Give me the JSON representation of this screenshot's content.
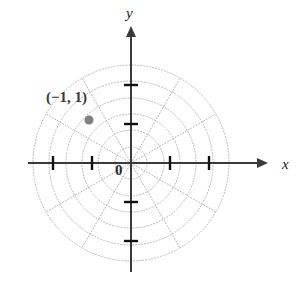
{
  "figure": {
    "background_color": "#ffffff",
    "width": 302,
    "height": 290
  },
  "axes": {
    "x_label": "x",
    "y_label": "y",
    "origin_label": "0",
    "origin": {
      "x": 131,
      "y": 163
    },
    "axis_color": "#3a3a3a",
    "x_axis": {
      "start_x": 28,
      "end_x": 268,
      "arrow": "right",
      "tick_offsets": [
        -78,
        -39,
        39,
        78
      ],
      "tick_half_length": 7
    },
    "y_axis": {
      "start_y": 272,
      "end_y": 26,
      "arrow": "up",
      "tick_offsets": [
        -78,
        -39,
        39,
        78
      ],
      "tick_half_length": 7
    }
  },
  "polar_grid": {
    "grid_color": "#b4b4b4",
    "dash_pattern": "1,2",
    "circle_radii": [
      16,
      33,
      49,
      65,
      82,
      98
    ],
    "spoke_count": 12,
    "spoke_angle_step_deg": 30,
    "spoke_radius": 98
  },
  "point": {
    "label": "(−1, 1)",
    "marker_color": "#808080",
    "marker_radius": 4.5,
    "px": {
      "x": 89,
      "y": 120
    },
    "label_px": {
      "x": 46,
      "y": 90
    }
  },
  "chart_data": {
    "type": "scatter",
    "title": "",
    "xlabel": "x",
    "ylabel": "y",
    "coordinate_system": "polar",
    "grid": true,
    "legend": null,
    "xlim": [
      -2.6,
      2.6
    ],
    "ylim": [
      -2.6,
      2.6
    ],
    "radial_gridlines": [
      0.4,
      0.85,
      1.25,
      1.65,
      2.1,
      2.5
    ],
    "angular_gridlines_deg": [
      0,
      30,
      60,
      90,
      120,
      150,
      180,
      210,
      240,
      270,
      300,
      330
    ],
    "x_tick_values": [
      -2,
      -1,
      1,
      2
    ],
    "y_tick_values": [
      -2,
      -1,
      1,
      2
    ],
    "points": [
      {
        "label": "(−1, 1)",
        "r": -1,
        "theta_deg": 45,
        "x": -1.07,
        "y": 1.1
      }
    ]
  }
}
